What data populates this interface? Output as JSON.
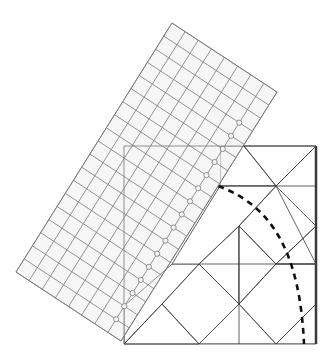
{
  "figure": {
    "description": "Rotated square-grid ruler laid over a pieced quilt block with a dashed curved cutting line",
    "colors": {
      "background": "#ffffff",
      "grid_line": "#7a7a7a",
      "ruler_tint": "#e6e6e6",
      "fabric_light": "#d8d8d8",
      "fabric_lighter": "#e2e2e2",
      "fabric_medium": "#9a9a9a",
      "fabric_dark": "#7d7d7d",
      "fabric_mottled": "#8e8e8e",
      "seam": "#3a3a3a",
      "dashed_curve": "#111111",
      "block_edge": "#3a3a3a"
    }
  },
  "ruler": {
    "corners": {
      "top": [
        172,
        23
      ],
      "right": [
        277,
        92
      ],
      "bottom": [
        124,
        344
      ],
      "left": [
        16,
        272
      ]
    },
    "columns": 8,
    "rows": 19,
    "marker_count": 16,
    "marker_column_from_right": 1
  },
  "quilt_block": {
    "x": 124,
    "y": 146,
    "width": 192,
    "height": 198,
    "right_edge_dark": true
  },
  "dashed_curve": {
    "style": "dashed",
    "from": [
      218,
      186
    ],
    "to": [
      304,
      344
    ]
  }
}
